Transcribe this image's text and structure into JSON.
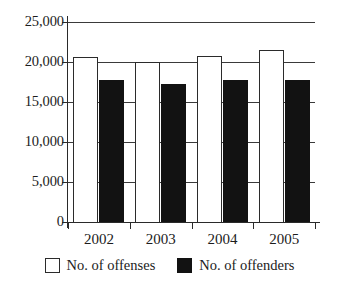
{
  "chart_data": {
    "type": "bar",
    "title": "",
    "subtitle": "",
    "xlabel": "",
    "ylabel": "",
    "categories": [
      "2002",
      "2003",
      "2004",
      "2005"
    ],
    "series": [
      {
        "name": "No. of offenses",
        "color": "#ffffff",
        "edge_color": "#2b2b2b",
        "values": [
          20600,
          20000,
          20800,
          21500
        ]
      },
      {
        "name": "No. of offenders",
        "color": "#121212",
        "edge_color": "#121212",
        "values": [
          17700,
          17200,
          17800,
          17700
        ]
      }
    ],
    "ylim": [
      0,
      25000
    ],
    "yticks": [
      0,
      5000,
      10000,
      15000,
      20000,
      25000
    ],
    "ytick_labels": [
      "0",
      "5,000",
      "10,000",
      "15,000",
      "20,000",
      "25,000"
    ],
    "grid": true,
    "grid_axis": "y",
    "legend": [
      "No. of offenses",
      "No. of offenders"
    ],
    "legend_position": "bottom-center"
  },
  "axes": {
    "y_ticks": [
      {
        "label": "25,000",
        "value": 25000
      },
      {
        "label": "20,000",
        "value": 20000
      },
      {
        "label": "15,000",
        "value": 15000
      },
      {
        "label": "10,000",
        "value": 10000
      },
      {
        "label": "5,000",
        "value": 5000
      },
      {
        "label": "0",
        "value": 0
      }
    ],
    "x_ticks": [
      {
        "label": "2002"
      },
      {
        "label": "2003"
      },
      {
        "label": "2004"
      },
      {
        "label": "2005"
      }
    ]
  },
  "legend": {
    "items": [
      {
        "label": "No. of offenses",
        "swatch": "white-square-swatch"
      },
      {
        "label": "No. of offenders",
        "swatch": "black-square-swatch"
      }
    ]
  }
}
